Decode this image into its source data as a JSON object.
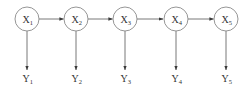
{
  "diagram": {
    "type": "hidden-markov-chain",
    "hidden_nodes": [
      {
        "id": "X1",
        "base": "X",
        "sub": "1"
      },
      {
        "id": "X2",
        "base": "X",
        "sub": "2"
      },
      {
        "id": "X3",
        "base": "X",
        "sub": "3"
      },
      {
        "id": "X4",
        "base": "X",
        "sub": "4"
      },
      {
        "id": "X5",
        "base": "X",
        "sub": "5"
      }
    ],
    "observed_nodes": [
      {
        "id": "Y1",
        "base": "Y",
        "sub": "1"
      },
      {
        "id": "Y2",
        "base": "Y",
        "sub": "2"
      },
      {
        "id": "Y3",
        "base": "Y",
        "sub": "3"
      },
      {
        "id": "Y4",
        "base": "Y",
        "sub": "4"
      },
      {
        "id": "Y5",
        "base": "Y",
        "sub": "5"
      }
    ],
    "edges": [
      {
        "from": "X1",
        "to": "X2"
      },
      {
        "from": "X2",
        "to": "X3"
      },
      {
        "from": "X3",
        "to": "X4"
      },
      {
        "from": "X4",
        "to": "X5"
      },
      {
        "from": "X1",
        "to": "Y1"
      },
      {
        "from": "X2",
        "to": "Y2"
      },
      {
        "from": "X3",
        "to": "Y3"
      },
      {
        "from": "X4",
        "to": "Y4"
      },
      {
        "from": "X5",
        "to": "Y5"
      }
    ]
  }
}
